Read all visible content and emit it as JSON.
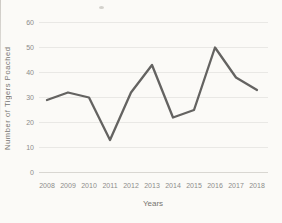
{
  "chart_data": {
    "type": "line",
    "title": "",
    "categories": [
      "2008",
      "2009",
      "2010",
      "2011",
      "2012",
      "2013",
      "2014",
      "2015",
      "2016",
      "2017",
      "2018"
    ],
    "values": [
      29,
      32,
      30,
      13,
      32,
      43,
      22,
      25,
      50,
      38,
      33
    ],
    "series_name": "Number of Tigers Poached",
    "xlabel": "Years",
    "ylabel": "Number of Tigers Poached",
    "ylim": [
      0,
      60
    ],
    "yticks": [
      0,
      10,
      20,
      30,
      40,
      50,
      60
    ],
    "grid": "horizontal",
    "legend": "none",
    "line_color": "#646361",
    "grid_color": "#e5e3df",
    "axis_line_color": "#d9d7d2",
    "tick_label_color": "#8d8c8a"
  }
}
